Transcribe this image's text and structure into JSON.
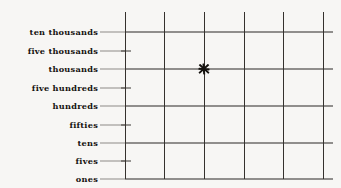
{
  "figure": {
    "background_color": "#f7f6f4",
    "ink_color": "#15120f",
    "rule_color_heavy": "#2a2724",
    "rule_color_light": "#6e6b66",
    "leader_color": "#8d8a85"
  },
  "rows": [
    {
      "label": "ten thousands",
      "y": 32,
      "weight": "heavy",
      "full_width": true
    },
    {
      "label": "five thousands",
      "y": 51,
      "weight": "light",
      "full_width": false
    },
    {
      "label": "thousands",
      "y": 69,
      "weight": "heavy",
      "full_width": true
    },
    {
      "label": "five hundreds",
      "y": 88,
      "weight": "light",
      "full_width": false
    },
    {
      "label": "hundreds",
      "y": 106,
      "weight": "heavy",
      "full_width": true
    },
    {
      "label": "fifties",
      "y": 125,
      "weight": "light",
      "full_width": false
    },
    {
      "label": "tens",
      "y": 143,
      "weight": "heavy",
      "full_width": true
    },
    {
      "label": "fives",
      "y": 161,
      "weight": "light",
      "full_width": false
    },
    {
      "label": "ones",
      "y": 179,
      "weight": "heavy",
      "full_width": true
    }
  ],
  "columns": [
    {
      "name": "column-1",
      "x": 125
    },
    {
      "name": "column-2",
      "x": 164
    },
    {
      "name": "column-3",
      "x": 204
    },
    {
      "name": "column-4",
      "x": 244
    },
    {
      "name": "column-5",
      "x": 283
    },
    {
      "name": "column-6",
      "x": 323
    }
  ],
  "grid": {
    "left": 125,
    "right": 333,
    "top": 12,
    "bottom": 179,
    "label_column_right": 98,
    "leader_start": 100,
    "stub_width": 10
  },
  "markers": [
    {
      "name": "x-marker",
      "glyph": "✕",
      "row_label": "thousands",
      "column_name": "column-3",
      "x": 204,
      "y": 69
    }
  ]
}
